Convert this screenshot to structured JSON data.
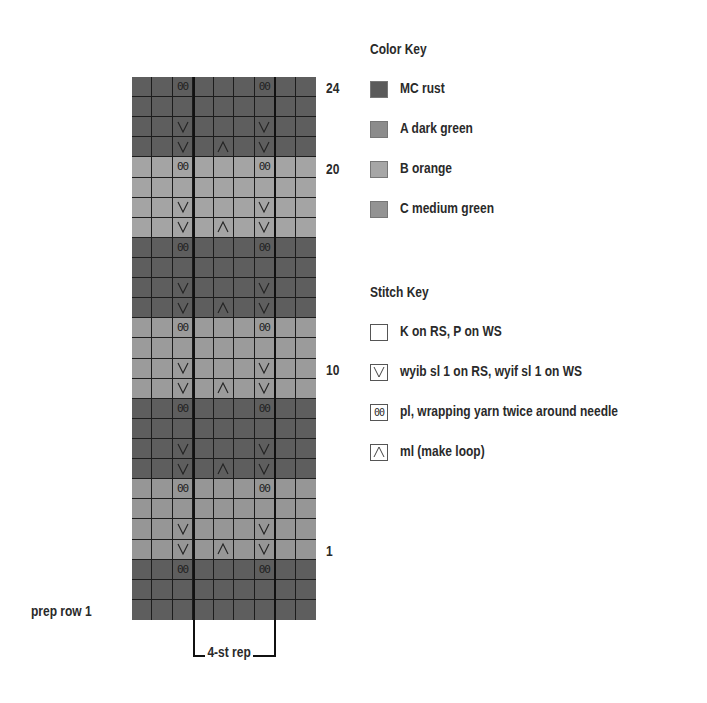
{
  "chart_data": {
    "type": "table",
    "columns": 9,
    "repeat": {
      "label": "4-st rep",
      "start_col": 4,
      "end_col": 7
    },
    "row_labels_shown": [
      {
        "row": 24,
        "text": "24"
      },
      {
        "row": 20,
        "text": "20"
      },
      {
        "row": 10,
        "text": "10"
      },
      {
        "row": 1,
        "text": "1"
      },
      {
        "row": "prep1",
        "text": "prep row 1"
      }
    ],
    "rows": [
      {
        "row": 24,
        "color": "MC",
        "stitches": [
          "",
          "",
          "pl",
          "",
          "",
          "",
          "pl",
          "",
          ""
        ]
      },
      {
        "row": 23,
        "color": "MC",
        "stitches": [
          "",
          "",
          "",
          "",
          "",
          "",
          "",
          "",
          ""
        ]
      },
      {
        "row": 22,
        "color": "MC",
        "stitches": [
          "",
          "",
          "sl",
          "",
          "",
          "",
          "sl",
          "",
          ""
        ]
      },
      {
        "row": 21,
        "color": "MC",
        "stitches": [
          "",
          "",
          "sl",
          "",
          "ml",
          "",
          "sl",
          "",
          ""
        ]
      },
      {
        "row": 20,
        "color": "B",
        "stitches": [
          "",
          "",
          "pl",
          "",
          "",
          "",
          "pl",
          "",
          ""
        ]
      },
      {
        "row": 19,
        "color": "B",
        "stitches": [
          "",
          "",
          "",
          "",
          "",
          "",
          "",
          "",
          ""
        ]
      },
      {
        "row": 18,
        "color": "B",
        "stitches": [
          "",
          "",
          "sl",
          "",
          "",
          "",
          "sl",
          "",
          ""
        ]
      },
      {
        "row": 17,
        "color": "B",
        "stitches": [
          "",
          "",
          "sl",
          "",
          "ml",
          "",
          "sl",
          "",
          ""
        ]
      },
      {
        "row": 16,
        "color": "MC",
        "stitches": [
          "",
          "",
          "pl",
          "",
          "",
          "",
          "pl",
          "",
          ""
        ]
      },
      {
        "row": 15,
        "color": "MC",
        "stitches": [
          "",
          "",
          "",
          "",
          "",
          "",
          "",
          "",
          ""
        ]
      },
      {
        "row": 14,
        "color": "MC",
        "stitches": [
          "",
          "",
          "sl",
          "",
          "",
          "",
          "sl",
          "",
          ""
        ]
      },
      {
        "row": 13,
        "color": "MC",
        "stitches": [
          "",
          "",
          "sl",
          "",
          "ml",
          "",
          "sl",
          "",
          ""
        ]
      },
      {
        "row": 12,
        "color": "C",
        "stitches": [
          "",
          "",
          "pl",
          "",
          "",
          "",
          "pl",
          "",
          ""
        ]
      },
      {
        "row": 11,
        "color": "C",
        "stitches": [
          "",
          "",
          "",
          "",
          "",
          "",
          "",
          "",
          ""
        ]
      },
      {
        "row": 10,
        "color": "C",
        "stitches": [
          "",
          "",
          "sl",
          "",
          "",
          "",
          "sl",
          "",
          ""
        ]
      },
      {
        "row": 9,
        "color": "C",
        "stitches": [
          "",
          "",
          "sl",
          "",
          "ml",
          "",
          "sl",
          "",
          ""
        ]
      },
      {
        "row": 8,
        "color": "MC",
        "stitches": [
          "",
          "",
          "pl",
          "",
          "",
          "",
          "pl",
          "",
          ""
        ]
      },
      {
        "row": 7,
        "color": "MC",
        "stitches": [
          "",
          "",
          "",
          "",
          "",
          "",
          "",
          "",
          ""
        ]
      },
      {
        "row": 6,
        "color": "MC",
        "stitches": [
          "",
          "",
          "sl",
          "",
          "",
          "",
          "sl",
          "",
          ""
        ]
      },
      {
        "row": 5,
        "color": "MC",
        "stitches": [
          "",
          "",
          "sl",
          "",
          "ml",
          "",
          "sl",
          "",
          ""
        ]
      },
      {
        "row": 4,
        "color": "A",
        "stitches": [
          "",
          "",
          "pl",
          "",
          "",
          "",
          "pl",
          "",
          ""
        ]
      },
      {
        "row": 3,
        "color": "A",
        "stitches": [
          "",
          "",
          "",
          "",
          "",
          "",
          "",
          "",
          ""
        ]
      },
      {
        "row": 2,
        "color": "A",
        "stitches": [
          "",
          "",
          "sl",
          "",
          "",
          "",
          "sl",
          "",
          ""
        ]
      },
      {
        "row": 1,
        "color": "A",
        "stitches": [
          "",
          "",
          "sl",
          "",
          "ml",
          "",
          "sl",
          "",
          ""
        ]
      },
      {
        "row": "prep3",
        "color": "MC",
        "stitches": [
          "",
          "",
          "pl",
          "",
          "",
          "",
          "pl",
          "",
          ""
        ]
      },
      {
        "row": "prep2",
        "color": "MC",
        "stitches": [
          "",
          "",
          "",
          "",
          "",
          "",
          "",
          "",
          ""
        ]
      },
      {
        "row": "prep1",
        "color": "MC",
        "stitches": [
          "",
          "",
          "",
          "",
          "",
          "",
          "",
          "",
          ""
        ]
      }
    ]
  },
  "colors": {
    "MC": "#5e5e5e",
    "A": "#969696",
    "B": "#a4a4a4",
    "C": "#9b9b9b"
  },
  "symbols": {
    "pl": "00",
    "sl": "slip-v-icon",
    "ml": "make-loop-caret-icon"
  },
  "color_key": {
    "title": "Color Key",
    "items": [
      {
        "code": "MC",
        "label": "MC  rust",
        "color": "#5a5a5a"
      },
      {
        "code": "A",
        "label": "A  dark green",
        "color": "#8c8c8c"
      },
      {
        "code": "B",
        "label": "B  orange",
        "color": "#a6a6a6"
      },
      {
        "code": "C",
        "label": "C  medium green",
        "color": "#939393"
      }
    ]
  },
  "stitch_key": {
    "title": "Stitch Key",
    "items": [
      {
        "symbol": "blank",
        "label": "K on RS, P on WS"
      },
      {
        "symbol": "sl",
        "label": "wyib sl 1 on RS, wyif sl 1 on WS"
      },
      {
        "symbol": "pl",
        "label": "pl, wrapping yarn twice around needle",
        "text": "00"
      },
      {
        "symbol": "ml",
        "label": "ml (make loop)"
      }
    ]
  }
}
